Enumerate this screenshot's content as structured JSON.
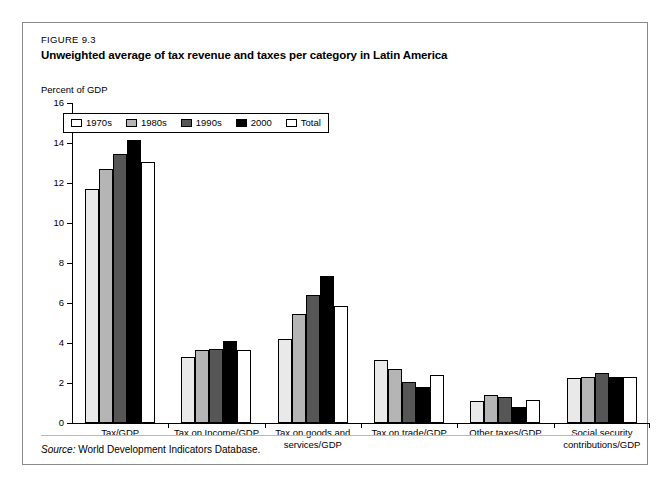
{
  "figure": {
    "number": "FIGURE 9.3",
    "title": "Unweighted average of tax revenue and taxes per category in Latin America",
    "axis_unit_label": "Percent of GDP",
    "source_word": "Source:",
    "source_text": "World Development Indicators Database."
  },
  "legend": {
    "items": [
      {
        "label": "1970s",
        "swatch": "s1970s",
        "color": "#ffffff"
      },
      {
        "label": "1980s",
        "swatch": "s1980s",
        "color": "#b5b5b5"
      },
      {
        "label": "1990s",
        "swatch": "s1990s",
        "color": "#565656"
      },
      {
        "label": "2000",
        "swatch": "s2000",
        "color": "#000000"
      },
      {
        "label": "Total",
        "swatch": "stotal",
        "color": "#ffffff"
      }
    ]
  },
  "chart_data": {
    "type": "bar",
    "title": "Unweighted average of tax revenue and taxes per category in Latin America",
    "xlabel": "",
    "ylabel": "Percent of GDP",
    "ylim": [
      0,
      16
    ],
    "yticks": [
      0,
      2,
      4,
      6,
      8,
      10,
      12,
      14,
      16
    ],
    "ytick_labels": [
      "0",
      "2",
      "4",
      "6",
      "8",
      "10",
      "12",
      "14",
      "16"
    ],
    "grid": false,
    "legend_position": "upper-left-inside",
    "categories": [
      "Tax/GDP",
      "Tax on Income/GDP",
      "Tax on goods and\nservices/GDP",
      "Tax on trade/GDP",
      "Other taxes/GDP",
      "Social security\ncontributions/GDP"
    ],
    "category_lines": [
      [
        "Tax/GDP"
      ],
      [
        "Tax on Income/GDP"
      ],
      [
        "Tax on goods and",
        "services/GDP"
      ],
      [
        "Tax on trade/GDP"
      ],
      [
        "Other taxes/GDP"
      ],
      [
        "Social security",
        "contributions/GDP"
      ]
    ],
    "series": [
      {
        "name": "1970s",
        "swatch": "s1970s",
        "values": [
          11.7,
          3.3,
          4.2,
          3.15,
          1.08,
          2.25
        ]
      },
      {
        "name": "1980s",
        "swatch": "s1980s",
        "values": [
          12.7,
          3.65,
          5.45,
          2.7,
          1.4,
          2.3
        ]
      },
      {
        "name": "1990s",
        "swatch": "s1990s",
        "values": [
          13.45,
          3.72,
          6.4,
          2.05,
          1.32,
          2.48
        ]
      },
      {
        "name": "2000",
        "swatch": "s2000",
        "values": [
          14.15,
          4.08,
          7.35,
          1.82,
          0.82,
          2.32
        ]
      },
      {
        "name": "Total",
        "swatch": "stotal",
        "values": [
          13.05,
          3.65,
          5.85,
          2.4,
          1.15,
          2.32
        ]
      }
    ]
  }
}
